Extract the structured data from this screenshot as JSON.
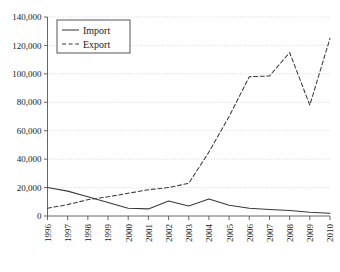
{
  "chart_data": {
    "type": "line",
    "title": "",
    "xlabel": "",
    "ylabel": "",
    "grid": true,
    "legend_position": "top-left",
    "categories": [
      "1996",
      "1997",
      "1998",
      "1999",
      "2000",
      "2001",
      "2002",
      "2003",
      "2004",
      "2005",
      "2006",
      "2007",
      "2008",
      "2009",
      "2010"
    ],
    "ylim": [
      0,
      140000
    ],
    "ytick_values": [
      0,
      20000,
      40000,
      60000,
      80000,
      100000,
      120000,
      140000
    ],
    "ytick_labels": [
      "0",
      "20,000",
      "40,000",
      "60,000",
      "80,000",
      "100,000",
      "120,000",
      "140,000"
    ],
    "series": [
      {
        "name": "Import",
        "style": "solid",
        "color": "#3a3a3a",
        "values": [
          20000,
          17500,
          13500,
          9500,
          5500,
          5000,
          10500,
          7000,
          12000,
          7500,
          5500,
          4500,
          3800,
          2600,
          2000
        ]
      },
      {
        "name": "Export",
        "style": "dashed",
        "color": "#3a3a3a",
        "values": [
          5500,
          8000,
          11500,
          13500,
          16000,
          18500,
          20000,
          23000,
          45000,
          70000,
          98000,
          98500,
          115000,
          78000,
          125000
        ]
      }
    ]
  },
  "legend": {
    "items": [
      {
        "label": "Import",
        "style": "solid"
      },
      {
        "label": "Export",
        "style": "dashed"
      }
    ]
  },
  "axes": {
    "y_min_label": "0",
    "y_max_label": "140,000"
  }
}
